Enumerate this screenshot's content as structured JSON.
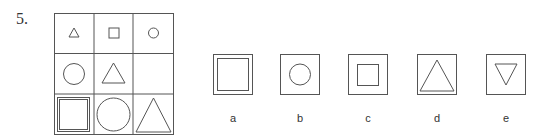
{
  "question": {
    "number": "5."
  },
  "matrix": {
    "rows": 3,
    "cols": 3,
    "cells": [
      [
        "small-triangle",
        "small-square",
        "small-circle"
      ],
      [
        "medium-circle",
        "medium-triangle",
        "empty"
      ],
      [
        "large-double-square",
        "large-circle",
        "large-triangle"
      ]
    ]
  },
  "options": [
    {
      "label": "a",
      "shape": "double-square"
    },
    {
      "label": "b",
      "shape": "circle"
    },
    {
      "label": "c",
      "shape": "square"
    },
    {
      "label": "d",
      "shape": "triangle"
    },
    {
      "label": "e",
      "shape": "inverted-triangle"
    }
  ],
  "colors": {
    "stroke": "#555555",
    "text": "#333333"
  }
}
